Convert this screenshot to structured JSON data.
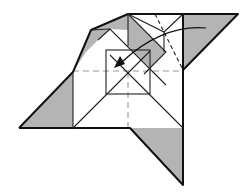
{
  "diagram": {
    "type": "origami-fold-step",
    "colors": {
      "paper_back": "#b4b4b4",
      "paper_front": "#ffffff",
      "line": "#111111",
      "crease": "#999999"
    },
    "elements": [
      {
        "name": "left-gray-triangle",
        "color": "gray"
      },
      {
        "name": "bottom-gray-triangle",
        "color": "gray"
      },
      {
        "name": "top-right-gray-triangle",
        "color": "gray"
      },
      {
        "name": "top-left-gray-flap",
        "color": "gray"
      },
      {
        "name": "diagonal-gray-strip",
        "color": "gray"
      },
      {
        "name": "inner-square",
        "color": "white"
      },
      {
        "name": "center-crease-horizontal",
        "style": "dashed"
      },
      {
        "name": "center-crease-vertical",
        "style": "dashed"
      },
      {
        "name": "valley-fold-line",
        "style": "dashed"
      },
      {
        "name": "fold-arrow",
        "direction": "toward-center"
      }
    ]
  }
}
